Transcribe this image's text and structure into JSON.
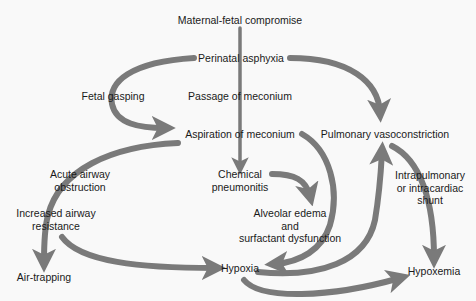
{
  "diagram": {
    "type": "flowchart",
    "colors": {
      "background": "#f9f9f9",
      "arrow": "#7a7a7a",
      "text": "#1a1a1a"
    },
    "nodes": {
      "maternal_fetal_compromise": "Maternal-fetal compromise",
      "perinatal_asphyxia": "Perinatal asphyxia",
      "fetal_gasping": "Fetal gasping",
      "passage_of_meconium": "Passage of meconium",
      "aspiration_of_meconium": "Aspiration of meconium",
      "pulmonary_vasoconstriction": "Pulmonary vasoconstriction",
      "acute_airway_obstruction_1": "Acute airway",
      "acute_airway_obstruction_2": "obstruction",
      "chemical_pneumonitis_1": "Chemical",
      "chemical_pneumonitis_2": "pneumonitis",
      "shunt_1": "Intrapulmonary",
      "shunt_2": "or intracardiac",
      "shunt_3": "shunt",
      "increased_airway_resistance_1": "Increased airway",
      "increased_airway_resistance_2": "resistance",
      "alveolar_edema_1": "Alveolar edema",
      "alveolar_edema_2": "and",
      "alveolar_edema_3": "surfactant dysfunction",
      "hypoxia": "Hypoxia",
      "air_trapping": "Air-trapping",
      "hypoxemia": "Hypoxemia"
    },
    "edges": [
      {
        "from": "Maternal-fetal compromise",
        "to": "Chemical pneumonitis",
        "via": [
          "Perinatal asphyxia",
          "Passage of meconium",
          "Aspiration of meconium"
        ]
      },
      {
        "from": "Perinatal asphyxia",
        "to": "Aspiration of meconium",
        "label": "Fetal gasping"
      },
      {
        "from": "Perinatal asphyxia",
        "to": "Pulmonary vasoconstriction"
      },
      {
        "from": "Aspiration of meconium",
        "to": "Air-trapping",
        "via": [
          "Acute airway obstruction",
          "Increased airway resistance"
        ]
      },
      {
        "from": "Aspiration of meconium",
        "to": "Hypoxia"
      },
      {
        "from": "Chemical pneumonitis",
        "to": "Alveolar edema and surfactant dysfunction"
      },
      {
        "from": "Increased airway resistance",
        "to": "Hypoxia"
      },
      {
        "from": "Hypoxia",
        "to": "Pulmonary vasoconstriction"
      },
      {
        "from": "Hypoxia",
        "to": "Hypoxemia"
      },
      {
        "from": "Pulmonary vasoconstriction",
        "to": "Hypoxemia",
        "label": "Intrapulmonary or intracardiac shunt"
      }
    ]
  }
}
